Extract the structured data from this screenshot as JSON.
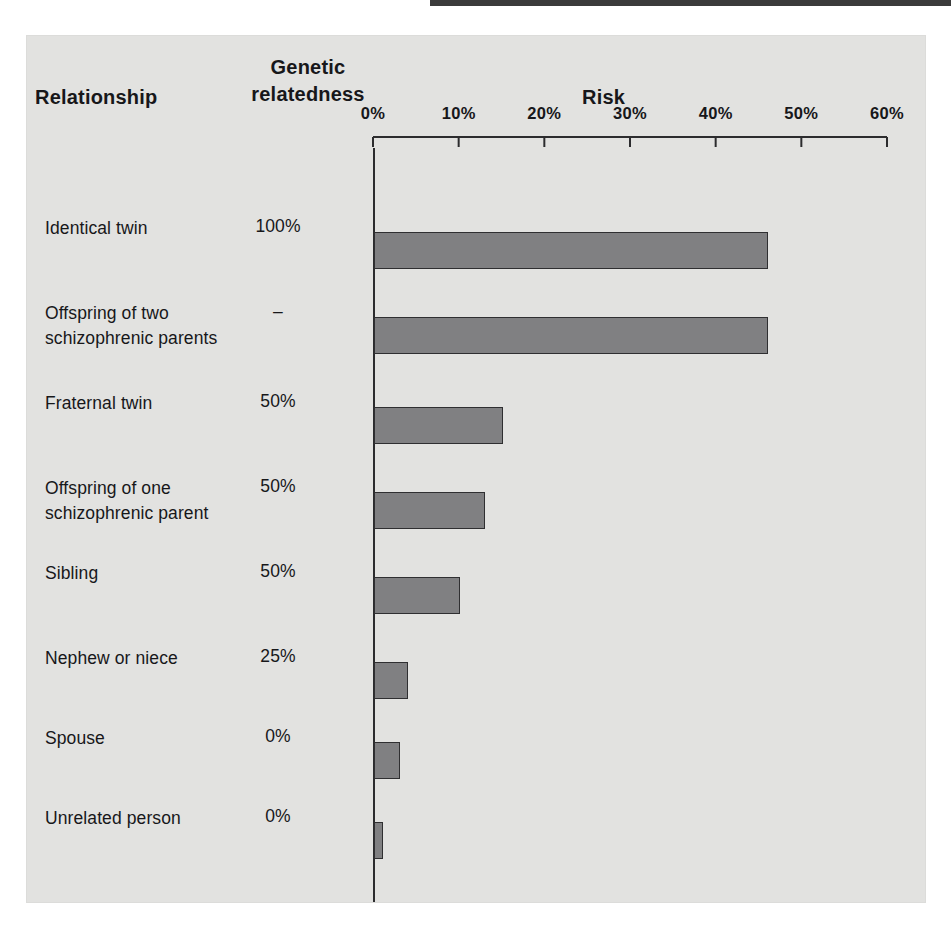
{
  "headers": {
    "relationship": "Relationship",
    "genetic_line1": "Genetic",
    "genetic_line2": "relatedness",
    "risk": "Risk"
  },
  "axis": {
    "ticks": [
      "0%",
      "10%",
      "20%",
      "30%",
      "40%",
      "50%",
      "60%"
    ]
  },
  "rows": [
    {
      "label_line1": "Identical twin",
      "label_line2": "",
      "genetic": "100%",
      "risk": 46
    },
    {
      "label_line1": "Offspring of two",
      "label_line2": "schizophrenic parents",
      "genetic": "–",
      "risk": 46
    },
    {
      "label_line1": "Fraternal twin",
      "label_line2": "",
      "genetic": "50%",
      "risk": 15
    },
    {
      "label_line1": "Offspring of one",
      "label_line2": "schizophrenic parent",
      "genetic": "50%",
      "risk": 13
    },
    {
      "label_line1": "Sibling",
      "label_line2": "",
      "genetic": "50%",
      "risk": 10
    },
    {
      "label_line1": "Nephew or niece",
      "label_line2": "",
      "genetic": "25%",
      "risk": 4
    },
    {
      "label_line1": "Spouse",
      "label_line2": "",
      "genetic": "0%",
      "risk": 3
    },
    {
      "label_line1": "Unrelated person",
      "label_line2": "",
      "genetic": "0%",
      "risk": 1
    }
  ],
  "colors": {
    "bar_fill": "#808082",
    "bar_stroke": "#2f2f31",
    "panel_background": "#e2e2e0",
    "text": "#17171a"
  },
  "chart_data": {
    "type": "bar",
    "orientation": "horizontal",
    "title": "Risk",
    "xlabel": "Risk",
    "ylabel": "Relationship",
    "xlim": [
      0,
      60
    ],
    "xticks": [
      0,
      10,
      20,
      30,
      40,
      50,
      60
    ],
    "xtick_labels": [
      "0%",
      "10%",
      "20%",
      "30%",
      "40%",
      "50%",
      "60%"
    ],
    "grid": false,
    "legend": "none",
    "categories": [
      "Identical twin",
      "Offspring of two schizophrenic parents",
      "Fraternal twin",
      "Offspring of one schizophrenic parent",
      "Sibling",
      "Nephew or niece",
      "Spouse",
      "Unrelated person"
    ],
    "values": [
      46,
      46,
      15,
      13,
      10,
      4,
      3,
      1
    ],
    "units": "percent",
    "annotations": {
      "genetic_relatedness": [
        "100%",
        "–",
        "50%",
        "50%",
        "50%",
        "25%",
        "0%",
        "0%"
      ]
    }
  }
}
